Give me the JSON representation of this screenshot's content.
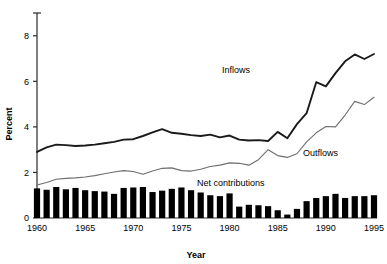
{
  "chart_data": {
    "type": "line",
    "title": "",
    "xlabel": "Year",
    "ylabel": "Percent",
    "xlim": [
      1960,
      1995
    ],
    "ylim": [
      0,
      9
    ],
    "grid": false,
    "legend_position": "inline-annotations",
    "xticks": [
      1960,
      1965,
      1970,
      1975,
      1980,
      1985,
      1990,
      1995
    ],
    "xtick_labels": [
      "1960",
      "1965",
      "1970",
      "1975",
      "1980",
      "1985",
      "1990",
      "1995"
    ],
    "yticks": [
      0,
      2,
      4,
      6,
      8
    ],
    "ytick_labels": [
      "0",
      "2",
      "4",
      "6",
      "8"
    ],
    "x": [
      1960,
      1961,
      1962,
      1963,
      1964,
      1965,
      1966,
      1967,
      1968,
      1969,
      1970,
      1971,
      1972,
      1973,
      1974,
      1975,
      1976,
      1977,
      1978,
      1979,
      1980,
      1981,
      1982,
      1983,
      1984,
      1985,
      1986,
      1987,
      1988,
      1989,
      1990,
      1991,
      1992,
      1993,
      1994,
      1995
    ],
    "series": [
      {
        "name": "Inflows",
        "style": "line-bold",
        "color": "#1a1a1a",
        "values": [
          2.9,
          3.1,
          3.22,
          3.2,
          3.16,
          3.18,
          3.22,
          3.28,
          3.34,
          3.44,
          3.46,
          3.6,
          3.76,
          3.9,
          3.74,
          3.7,
          3.64,
          3.6,
          3.66,
          3.54,
          3.62,
          3.44,
          3.4,
          3.42,
          3.38,
          3.78,
          3.5,
          4.12,
          4.6,
          5.96,
          5.78,
          6.36,
          6.88,
          7.18,
          6.98,
          7.2
        ]
      },
      {
        "name": "Outflows",
        "style": "line-thin",
        "color": "#6e6e6e",
        "values": [
          1.45,
          1.56,
          1.7,
          1.74,
          1.76,
          1.8,
          1.86,
          1.94,
          2.02,
          2.08,
          2.04,
          1.92,
          2.06,
          2.18,
          2.2,
          2.08,
          2.06,
          2.14,
          2.26,
          2.32,
          2.42,
          2.4,
          2.32,
          2.56,
          3.0,
          2.74,
          2.66,
          2.82,
          3.34,
          3.74,
          4.02,
          4.0,
          4.52,
          5.12,
          4.98,
          5.3
        ]
      }
    ],
    "bar_series": {
      "name": "Net contributions",
      "style": "bar",
      "color": "#000000",
      "values": [
        1.3,
        1.24,
        1.36,
        1.26,
        1.32,
        1.22,
        1.18,
        1.16,
        1.06,
        1.32,
        1.34,
        1.36,
        1.14,
        1.2,
        1.28,
        1.34,
        1.22,
        1.12,
        1.0,
        0.96,
        1.08,
        0.5,
        0.58,
        0.56,
        0.52,
        0.34,
        0.15,
        0.4,
        0.74,
        0.88,
        0.96,
        1.06,
        0.88,
        0.96,
        0.96,
        1.0
      ]
    },
    "annotations": [
      {
        "name": "inflows-label",
        "text": "Inflows",
        "x_px": 222,
        "y_px": 73
      },
      {
        "name": "outflows-label",
        "text": "Outflows",
        "x_px": 303,
        "y_px": 156
      },
      {
        "name": "net-contributions-label",
        "text": "Net contributions",
        "x_px": 197,
        "y_px": 186
      }
    ]
  },
  "axes": {
    "y_title": "Percent",
    "x_title": "Year"
  }
}
